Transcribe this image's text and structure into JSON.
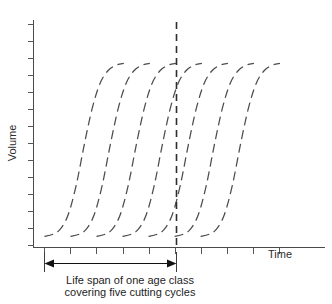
{
  "figure": {
    "y_axis_label": "Volume",
    "x_axis_label": "Time",
    "caption_line_1": "Life span of one age class",
    "caption_line_2": "covering five cutting cycles",
    "curve_color": "#4c4c4c",
    "axis_color": "#4a4a4a",
    "divider_color": "#2d2d2d",
    "arrow_color": "#121212",
    "background_color": "#ffffff"
  },
  "chart_data": {
    "type": "line",
    "title": "",
    "subtitle": "",
    "xlabel": "Time",
    "ylabel": "Volume",
    "xlim": [
      0,
      11.2
    ],
    "ylim": [
      0,
      1.15
    ],
    "grid": false,
    "legend_position": "none",
    "axis_tick_labels_shown": false,
    "x_tick_count": 10,
    "y_tick_count": 14,
    "annotations": [
      {
        "name": "cutting-cycle-divider",
        "type": "vertical-dashed-line",
        "x": 5.0,
        "label": ""
      },
      {
        "name": "life-span-span-arrow",
        "type": "double-headed-arrow",
        "x_start": 0.42,
        "x_end": 5.0,
        "label": "Life span of one age class covering five cutting cycles"
      }
    ],
    "series": [
      {
        "name": "cohort-1",
        "shape": "sigmoid",
        "x_offset": 0.42,
        "values": [
          0.02,
          0.03,
          0.06,
          0.14,
          0.3,
          0.52,
          0.72,
          0.86,
          0.93,
          0.96,
          0.97
        ]
      },
      {
        "name": "cohort-2",
        "shape": "sigmoid",
        "x_offset": 1.42,
        "values": [
          0.02,
          0.03,
          0.06,
          0.14,
          0.3,
          0.52,
          0.72,
          0.86,
          0.93,
          0.96,
          0.97
        ]
      },
      {
        "name": "cohort-3",
        "shape": "sigmoid",
        "x_offset": 2.42,
        "values": [
          0.02,
          0.03,
          0.06,
          0.14,
          0.3,
          0.52,
          0.72,
          0.86,
          0.93,
          0.96,
          0.97
        ]
      },
      {
        "name": "cohort-4",
        "shape": "sigmoid",
        "x_offset": 3.42,
        "values": [
          0.02,
          0.03,
          0.06,
          0.14,
          0.3,
          0.52,
          0.72,
          0.86,
          0.93,
          0.96,
          0.97
        ]
      },
      {
        "name": "cohort-5",
        "shape": "sigmoid",
        "x_offset": 4.42,
        "values": [
          0.02,
          0.03,
          0.06,
          0.14,
          0.3,
          0.52,
          0.72,
          0.86,
          0.93,
          0.96,
          0.97
        ]
      },
      {
        "name": "cohort-6",
        "shape": "sigmoid",
        "x_offset": 5.42,
        "values": [
          0.02,
          0.03,
          0.06,
          0.14,
          0.3,
          0.52,
          0.72,
          0.86,
          0.93,
          0.96,
          0.97
        ]
      },
      {
        "name": "cohort-7",
        "shape": "sigmoid",
        "x_offset": 6.42,
        "values": [
          0.02,
          0.03,
          0.06,
          0.14,
          0.3,
          0.52,
          0.72,
          0.86,
          0.93,
          0.96,
          0.97
        ]
      }
    ]
  }
}
